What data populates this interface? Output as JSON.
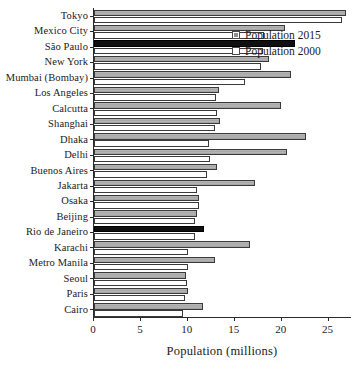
{
  "chart_data": {
    "type": "bar",
    "orientation": "horizontal",
    "title": "",
    "xlabel": "Population (millions)",
    "ylabel": "",
    "xlim": [
      0,
      27.5
    ],
    "xticks": [
      0,
      5,
      10,
      15,
      20,
      25
    ],
    "xtick_labels": [
      "0",
      "5",
      "10",
      "15",
      "20",
      "25"
    ],
    "grid": false,
    "legend_position": "top-right",
    "categories": [
      "Cairo",
      "Paris",
      "Seoul",
      "Metro Manila",
      "Karachi",
      "Rio de Janeiro",
      "Beijing",
      "Osaka",
      "Jakarta",
      "Buenos Aires",
      "Delhi",
      "Dhaka",
      "Shanghai",
      "Calcutta",
      "Los Angeles",
      "Mumbai (Bombay)",
      "New York",
      "São Paulo",
      "Mexico City",
      "Tokyo"
    ],
    "series": [
      {
        "name": "Population 2015",
        "color": "#ababab",
        "values": [
          11.6,
          10.0,
          9.8,
          12.9,
          16.6,
          11.7,
          11.0,
          11.2,
          17.2,
          13.1,
          20.6,
          22.6,
          13.4,
          19.9,
          13.3,
          21.0,
          18.6,
          21.4,
          20.4,
          26.9
        ],
        "highlighted": [
          "Rio de Janeiro",
          "São Paulo"
        ],
        "highlight_color": "#101010"
      },
      {
        "name": "Population 2000",
        "color": "#ffffff",
        "values": [
          9.5,
          9.7,
          9.9,
          10.0,
          10.0,
          10.8,
          10.8,
          11.2,
          11.0,
          12.0,
          12.4,
          12.3,
          12.9,
          13.1,
          13.0,
          16.1,
          17.8,
          18.0,
          18.1,
          26.4
        ]
      }
    ]
  },
  "legend": {
    "items": [
      {
        "label": "Population 2015",
        "swatch": "filled"
      },
      {
        "label": "Population 2000",
        "swatch": "empty"
      }
    ]
  },
  "axis": {
    "x_title": "Population (millions)"
  }
}
